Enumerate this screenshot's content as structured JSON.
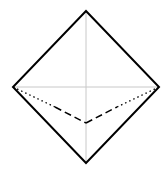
{
  "diagram": {
    "type": "origami-fold-step",
    "background": "#ffffff",
    "paper": {
      "shape": "square-rotated-45",
      "vertices": {
        "top": [
          86,
          11
        ],
        "right": [
          159,
          87
        ],
        "bottom": [
          86,
          163
        ],
        "left": [
          13,
          87
        ]
      },
      "stroke": "#000000",
      "stroke_width": 2
    },
    "creases": [
      {
        "name": "vertical-diagonal",
        "from": [
          86,
          11
        ],
        "to": [
          86,
          163
        ],
        "color": "#c8c8c8"
      },
      {
        "name": "horizontal-diagonal",
        "from": [
          13,
          87
        ],
        "to": [
          159,
          87
        ],
        "color": "#c8c8c8"
      }
    ],
    "fold_lines": [
      {
        "name": "left-dotted",
        "style": "dotted",
        "from": [
          13,
          87
        ],
        "to": [
          55,
          107
        ]
      },
      {
        "name": "left-dashed",
        "style": "dashed",
        "from": [
          55,
          107
        ],
        "to": [
          86,
          123
        ]
      },
      {
        "name": "right-dashed",
        "style": "dashed",
        "from": [
          86,
          123
        ],
        "to": [
          117,
          107
        ]
      },
      {
        "name": "right-dotted",
        "style": "dotted",
        "from": [
          117,
          107
        ],
        "to": [
          159,
          87
        ]
      }
    ],
    "fold_color": "#000000"
  }
}
